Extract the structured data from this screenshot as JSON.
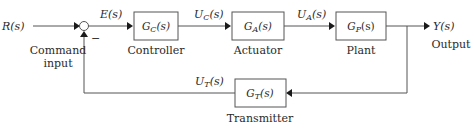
{
  "diagram": {
    "type": "feedback-control-loop",
    "input": {
      "signal": "R(s)",
      "caption_line1": "Command",
      "caption_line2": "input"
    },
    "summing_junction": {
      "feedback_sign": "−"
    },
    "error_signal": "E(s)",
    "blocks": [
      {
        "id": "controller",
        "transfer": "G",
        "sub": "C",
        "arg": "(s)",
        "caption": "Controller"
      },
      {
        "id": "actuator",
        "transfer": "G",
        "sub": "A",
        "arg": "(s)",
        "caption": "Actuator"
      },
      {
        "id": "plant",
        "transfer": "G",
        "sub": "P",
        "arg": "(s)",
        "caption": "Plant"
      },
      {
        "id": "transmitter",
        "transfer": "G",
        "sub": "T",
        "arg": "(s)",
        "caption": "Transmitter"
      }
    ],
    "signals": {
      "controller_out": {
        "base": "U",
        "sub": "C",
        "arg": "(s)"
      },
      "actuator_out": {
        "base": "U",
        "sub": "A",
        "arg": "(s)"
      },
      "transmitter_out": {
        "base": "U",
        "sub": "T",
        "arg": "(s)"
      }
    },
    "output": {
      "signal": "Y(s)",
      "caption": "Output"
    }
  }
}
